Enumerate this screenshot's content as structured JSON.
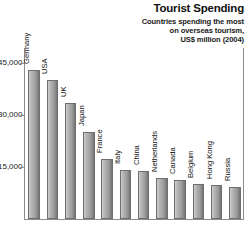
{
  "title": "Tourist Spending",
  "subtitle_lines": [
    "Countries spending the most",
    "on overseas tourism,",
    "US$ million (2004)"
  ],
  "axis": {
    "y_ticks": [
      "45,000",
      "30,000",
      "15,000"
    ],
    "y_tick_values": [
      45000,
      30000,
      15000
    ],
    "y_min": 0,
    "y_max": 50000
  },
  "chart_data": {
    "type": "bar",
    "title": "Tourist Spending",
    "subtitle": "Countries spending the most on overseas tourism, US$ million (2004)",
    "xlabel": "",
    "ylabel": "US$ million",
    "ylim": [
      0,
      50000
    ],
    "yticks": [
      15000,
      30000,
      45000
    ],
    "grid": false,
    "legend": "none",
    "categories": [
      "Germany",
      "USA",
      "UK",
      "Japan",
      "France",
      "Italy",
      "China",
      "Netherlands",
      "Canada",
      "Belgium",
      "Hong Kong",
      "Russia"
    ],
    "values": [
      43700,
      40600,
      33900,
      25500,
      17500,
      14300,
      14000,
      12100,
      11400,
      10300,
      10000,
      9400
    ]
  },
  "colors": {
    "bar_light": "#d2d2d2",
    "bar_mid": "#a8a8a8",
    "bar_dark": "#747474",
    "bar_border": "#6e6e6e",
    "axis": "#8c8c8c",
    "text": "#111111"
  }
}
